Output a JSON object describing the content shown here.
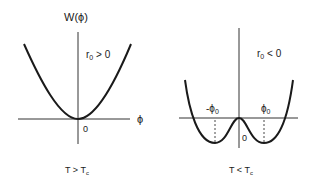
{
  "figure": {
    "left_panel": {
      "y_axis_label": "W(ϕ)",
      "x_axis_label": "ϕ",
      "condition_label": "r",
      "condition_sub": "0",
      "condition_rel": " > 0",
      "origin_label": "0",
      "caption_main": "T > T",
      "caption_sub": "c",
      "curve": "single-well parabola with minimum at origin"
    },
    "right_panel": {
      "condition_label": "r",
      "condition_sub": "0",
      "condition_rel": " < 0",
      "neg_min_label": "-ϕ",
      "neg_min_sub": "0",
      "pos_min_label": "ϕ",
      "pos_min_sub": "0",
      "origin_label": "0",
      "caption_main": "T < T",
      "caption_sub": "c",
      "curve": "double-well potential with minima at ±ϕ₀ and local maximum at origin"
    },
    "colors": {
      "line": "#1a1a1a",
      "axis": "#333333",
      "background": "#ffffff"
    }
  }
}
